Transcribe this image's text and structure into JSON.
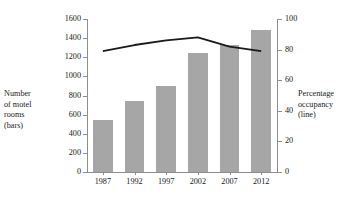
{
  "chart_data": {
    "type": "bar",
    "title": "",
    "categories": [
      "1987",
      "1992",
      "1997",
      "2002",
      "2007",
      "2012"
    ],
    "series": [
      {
        "name": "Number of motel rooms (bars)",
        "type": "bar",
        "axis": "left",
        "values": [
          540,
          745,
          900,
          1240,
          1325,
          1490
        ],
        "color": "#a6a6a6"
      },
      {
        "name": "Percentage occupancy (line)",
        "type": "line",
        "axis": "right",
        "values": [
          79,
          83,
          86,
          88,
          82,
          79
        ],
        "color": "#1a1a1a"
      }
    ],
    "xlabel": "",
    "ylabel": "Number of motel rooms (bars)",
    "y2label": "Percentage occupancy (line)",
    "ylim": [
      0,
      1600
    ],
    "y2lim": [
      0,
      100
    ],
    "yticks": [
      0,
      200,
      400,
      600,
      800,
      1000,
      1200,
      1400,
      1600
    ],
    "y2ticks": [
      0,
      20,
      40,
      60,
      80,
      100
    ],
    "grid": false,
    "legend": "none"
  },
  "axes": {
    "left_title": "Number\nof motel\nrooms\n(bars)",
    "right_title": "Percentage\noccupancy\n(line)"
  },
  "colors": {
    "bar_fill": "#a6a6a6",
    "line_stroke": "#1a1a1a",
    "axis": "#8e8e8e",
    "text": "#1a1a1a",
    "background": "#ffffff"
  }
}
